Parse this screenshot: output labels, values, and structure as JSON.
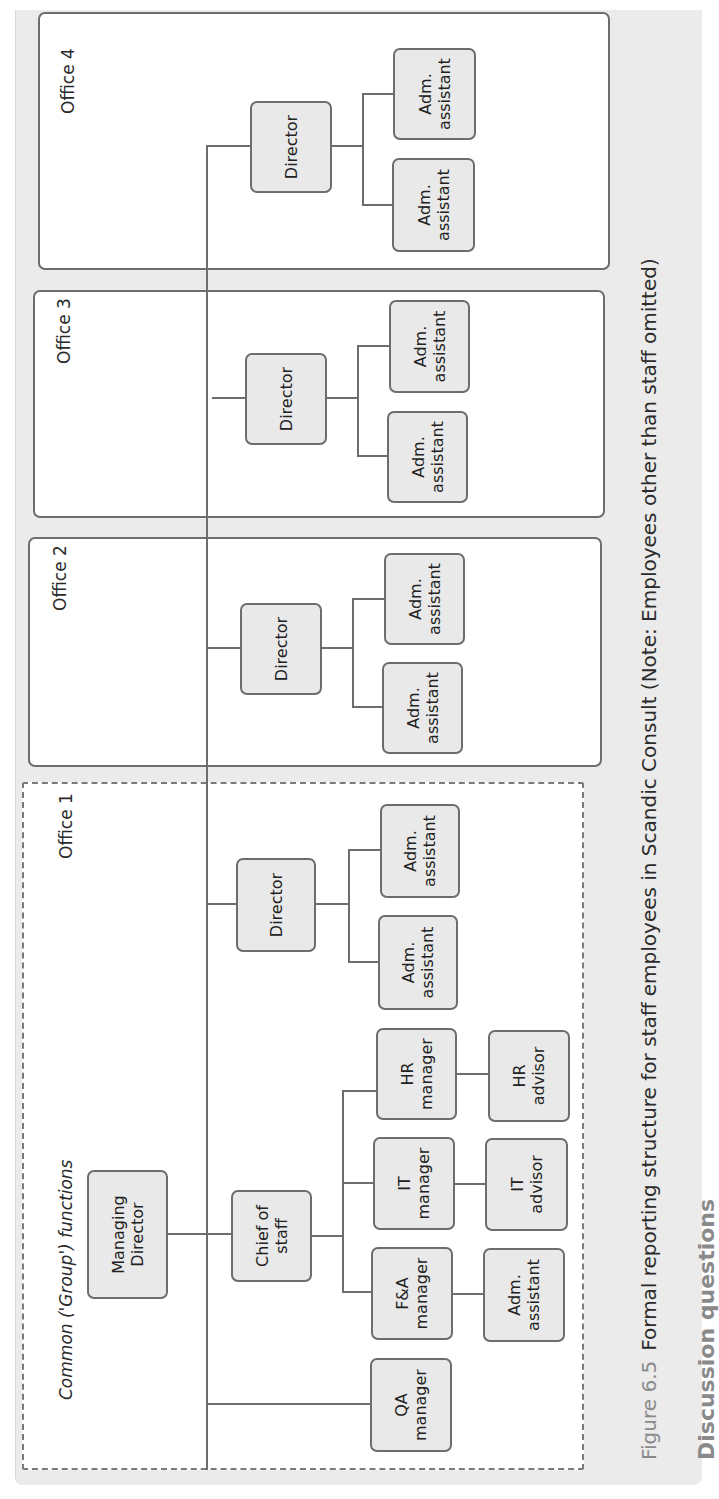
{
  "figure": {
    "number": "Figure 6.5",
    "caption": "Formal reporting structure for staff employees in Scandic Consult (Note: Employees other than staff omitted)",
    "next_heading": "Discussion questions"
  },
  "common": {
    "label": "Common ('Group') functions",
    "managing_director": "Managing\nDirector",
    "chief_of_staff": "Chief of\nstaff",
    "qa_manager": "QA\nmanager",
    "fa_manager": "F&A\nmanager",
    "fa_assistant": "Adm.\nassistant",
    "it_manager": "IT\nmanager",
    "it_advisor": "IT\nadvisor",
    "hr_manager": "HR\nmanager",
    "hr_advisor": "HR\nadvisor"
  },
  "offices": [
    {
      "label": "Office 1",
      "director": "Director",
      "assistants": [
        "Adm.\nassistant",
        "Adm.\nassistant"
      ]
    },
    {
      "label": "Office 2",
      "director": "Director",
      "assistants": [
        "Adm.\nassistant",
        "Adm.\nassistant"
      ]
    },
    {
      "label": "Office 3",
      "director": "Director",
      "assistants": [
        "Adm.\nassistant",
        "Adm.\nassistant"
      ]
    },
    {
      "label": "Office 4",
      "director": "Director",
      "assistants": [
        "Adm.\nassistant",
        "Adm.\nassistant"
      ]
    }
  ],
  "colors": {
    "node_fill": "#e9e9e9",
    "line": "#6d6d6d",
    "frame_bg": "#ebebeb",
    "figure_number": "#8a8a8a"
  }
}
